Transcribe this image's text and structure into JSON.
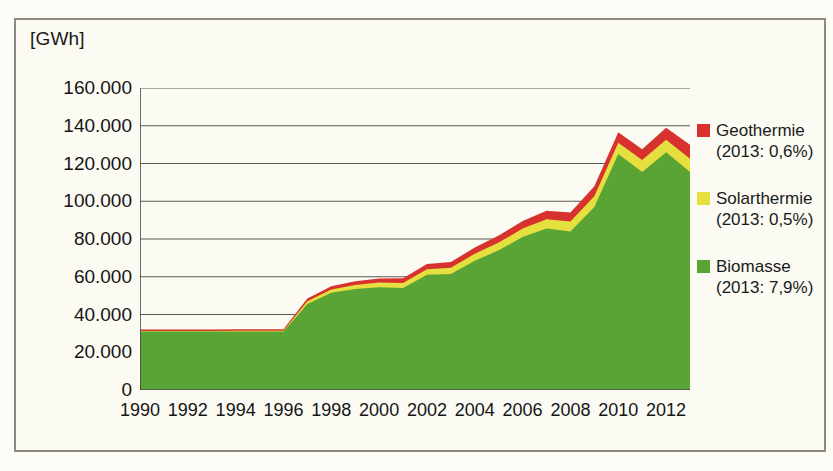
{
  "chart_data": {
    "type": "area",
    "stacked": true,
    "title": "",
    "subtitle": "",
    "xlabel": "",
    "ylabel": "[GWh]",
    "unit": "[GWh]",
    "grid": true,
    "legend_position": "right",
    "ylim": [
      0,
      160000
    ],
    "ytick_step": 20000,
    "ytick_labels": [
      "160.000",
      "140.000",
      "120.000",
      "100.000",
      "80.000",
      "60.000",
      "40.000",
      "20.000",
      "0"
    ],
    "ytick_values": [
      160000,
      140000,
      120000,
      100000,
      80000,
      60000,
      40000,
      20000,
      0
    ],
    "xlim": [
      1990,
      2013
    ],
    "x": [
      1990,
      1991,
      1992,
      1993,
      1994,
      1995,
      1996,
      1997,
      1998,
      1999,
      2000,
      2001,
      2002,
      2003,
      2004,
      2005,
      2006,
      2007,
      2008,
      2009,
      2010,
      2011,
      2012,
      2013
    ],
    "xtick_labels": [
      "1990",
      "1992",
      "1994",
      "1996",
      "1998",
      "2000",
      "2002",
      "2004",
      "2006",
      "2008",
      "2010",
      "2012"
    ],
    "xtick_values": [
      1990,
      1992,
      1994,
      1996,
      1998,
      2000,
      2002,
      2004,
      2006,
      2008,
      2010,
      2012
    ],
    "xtick_minor_values": [
      1990,
      1991,
      1992,
      1993,
      1994,
      1995,
      1996,
      1997,
      1998,
      1999,
      2000,
      2001,
      2002,
      2003,
      2004,
      2005,
      2006,
      2007,
      2008,
      2009,
      2010,
      2011,
      2012,
      2013
    ],
    "series": [
      {
        "name": "Biomasse",
        "legend_label": "Biomasse",
        "legend_sub": "(2013: 7,9%)",
        "color": "#5aa335",
        "values": [
          31000,
          31000,
          31000,
          31000,
          31000,
          31000,
          31000,
          45500,
          51500,
          53500,
          54500,
          54000,
          61000,
          61500,
          68500,
          74000,
          81000,
          85500,
          84000,
          97000,
          125000,
          115500,
          126000,
          115500
        ]
      },
      {
        "name": "Solarthermie",
        "legend_label": "Solarthermie",
        "legend_sub": "(2013: 0,5%)",
        "color": "#e5e040",
        "values": [
          200,
          200,
          250,
          300,
          350,
          400,
          450,
          1500,
          1800,
          2100,
          2400,
          2700,
          3000,
          3300,
          3700,
          4100,
          4500,
          5000,
          5300,
          5700,
          6000,
          6300,
          6600,
          7000
        ]
      },
      {
        "name": "Geothermie",
        "legend_label": "Geothermie",
        "legend_sub": "(2013: 0,6%)",
        "color": "#d8322e",
        "values": [
          800,
          800,
          800,
          800,
          800,
          800,
          800,
          1500,
          1700,
          2000,
          2200,
          2500,
          2800,
          3000,
          3300,
          3700,
          4000,
          4500,
          4700,
          5300,
          5500,
          5700,
          6400,
          7500
        ]
      }
    ],
    "totals": [
      32000,
      32000,
      32050,
      32100,
      32150,
      32200,
      32250,
      48500,
      55000,
      57600,
      59100,
      59200,
      66800,
      67800,
      75500,
      81800,
      89500,
      95000,
      94000,
      108000,
      136500,
      127500,
      139000,
      130000
    ],
    "colors": {
      "biomasse": "#5aa335",
      "solarthermie": "#e5e040",
      "geothermie": "#d8322e",
      "gridline": "#5a5a52",
      "axis": "#4a4a44",
      "background": "#fbfaf3",
      "frame": "#8c8a7e",
      "text": "#151515"
    }
  },
  "legend": {
    "entries": [
      {
        "label": "Geothermie",
        "sub": "(2013: 0,6%)",
        "color": "#d8322e"
      },
      {
        "label": "Solarthermie",
        "sub": "(2013: 0,5%)",
        "color": "#e5e040"
      },
      {
        "label": "Biomasse",
        "sub": "(2013: 7,9%)",
        "color": "#5aa335"
      }
    ]
  }
}
